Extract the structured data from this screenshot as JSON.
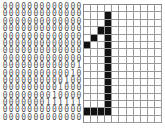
{
  "digit_matrix": [
    "0000000000000",
    "0000000000000",
    "0000000000000",
    "0000000000000",
    "0000000000000",
    "0000000000000",
    "0000000000000",
    "0000000000000",
    "0000000000001",
    "0000000000010",
    "0000000000100",
    "0000000001000",
    "0000000010000",
    "0000000111111",
    "0000000000000",
    "0000000000000"
  ],
  "pixel_grid": {
    "cols": 11,
    "rows": 16,
    "on_color": "#111111",
    "on_cells": [
      [
        1,
        3
      ],
      [
        2,
        3
      ],
      [
        3,
        2
      ],
      [
        3,
        3
      ],
      [
        4,
        1
      ],
      [
        4,
        3
      ],
      [
        5,
        0
      ],
      [
        5,
        3
      ],
      [
        6,
        3
      ],
      [
        7,
        3
      ],
      [
        8,
        3
      ],
      [
        9,
        3
      ],
      [
        10,
        3
      ],
      [
        11,
        3
      ],
      [
        12,
        3
      ],
      [
        13,
        3
      ],
      [
        14,
        0
      ],
      [
        14,
        1
      ],
      [
        14,
        2
      ],
      [
        14,
        3
      ]
    ]
  }
}
